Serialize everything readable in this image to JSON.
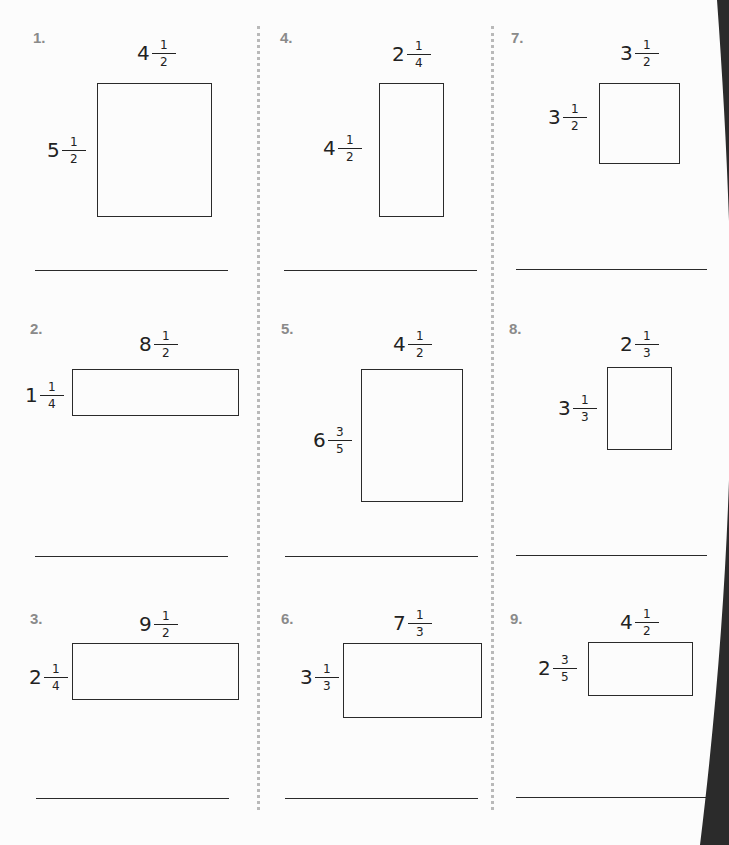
{
  "worksheet": {
    "problems": [
      {
        "number": "1.",
        "top": {
          "whole": "4",
          "num": "1",
          "den": "2"
        },
        "side": {
          "whole": "5",
          "num": "1",
          "den": "2"
        }
      },
      {
        "number": "2.",
        "top": {
          "whole": "8",
          "num": "1",
          "den": "2"
        },
        "side": {
          "whole": "1",
          "num": "1",
          "den": "4"
        }
      },
      {
        "number": "3.",
        "top": {
          "whole": "9",
          "num": "1",
          "den": "2"
        },
        "side": {
          "whole": "2",
          "num": "1",
          "den": "4"
        }
      },
      {
        "number": "4.",
        "top": {
          "whole": "2",
          "num": "1",
          "den": "4"
        },
        "side": {
          "whole": "4",
          "num": "1",
          "den": "2"
        }
      },
      {
        "number": "5.",
        "top": {
          "whole": "4",
          "num": "1",
          "den": "2"
        },
        "side": {
          "whole": "6",
          "num": "3",
          "den": "5"
        }
      },
      {
        "number": "6.",
        "top": {
          "whole": "7",
          "num": "1",
          "den": "3"
        },
        "side": {
          "whole": "3",
          "num": "1",
          "den": "3"
        }
      },
      {
        "number": "7.",
        "top": {
          "whole": "3",
          "num": "1",
          "den": "2"
        },
        "side": {
          "whole": "3",
          "num": "1",
          "den": "2"
        }
      },
      {
        "number": "8.",
        "top": {
          "whole": "2",
          "num": "1",
          "den": "3"
        },
        "side": {
          "whole": "3",
          "num": "1",
          "den": "3"
        }
      },
      {
        "number": "9.",
        "top": {
          "whole": "4",
          "num": "1",
          "den": "2"
        },
        "side": {
          "whole": "2",
          "num": "3",
          "den": "5"
        }
      }
    ]
  },
  "colors": {
    "ink": "#222222",
    "number_gray": "#8a8a8a",
    "divider": "#b9b9b9",
    "edge_shadow": "#2b2b2b"
  }
}
